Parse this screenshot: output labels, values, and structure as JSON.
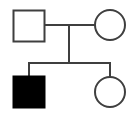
{
  "figure": {
    "kind": "pedigree-chart",
    "width": 136,
    "height": 115,
    "background_color": "#ffffff",
    "line_color": "#3f3f3f",
    "affected_fill_color": "#000000",
    "unaffected_fill_color": "#ffffff",
    "stroke_width": 2
  },
  "chart_data": {
    "type": "diagram",
    "title": "",
    "legend": [],
    "generations": [
      {
        "label": "I",
        "y_center": 25,
        "individuals": [
          {
            "id": "I-1",
            "shape": "square",
            "sex": "male",
            "affected": false,
            "fill": "#ffffff",
            "x": 13,
            "y": 10,
            "width": 31,
            "height": 31
          },
          {
            "id": "I-2",
            "shape": "circle",
            "sex": "female",
            "affected": false,
            "fill": "#ffffff",
            "cx": 110,
            "cy": 25,
            "r": 15
          }
        ]
      },
      {
        "label": "II",
        "y_center": 91,
        "individuals": [
          {
            "id": "II-1",
            "shape": "square",
            "sex": "male",
            "affected": true,
            "fill": "#000000",
            "x": 13,
            "y": 76,
            "width": 31,
            "height": 31
          },
          {
            "id": "II-2",
            "shape": "circle",
            "sex": "female",
            "affected": false,
            "fill": "#ffffff",
            "cx": 110,
            "cy": 92,
            "r": 15
          }
        ]
      }
    ],
    "connectors": [
      {
        "id": "mating-line",
        "kind": "horizontal",
        "x1": 44,
        "x2": 95,
        "y": 25
      },
      {
        "id": "descent-line",
        "kind": "vertical",
        "x": 69,
        "y1": 25,
        "y2": 63
      },
      {
        "id": "sibship-line",
        "kind": "horizontal",
        "x1": 29,
        "x2": 110,
        "y": 63
      },
      {
        "id": "child-drop-left",
        "kind": "vertical",
        "x": 29,
        "y1": 63,
        "y2": 76
      },
      {
        "id": "child-drop-right",
        "kind": "vertical",
        "x": 110,
        "y1": 63,
        "y2": 77
      }
    ]
  }
}
